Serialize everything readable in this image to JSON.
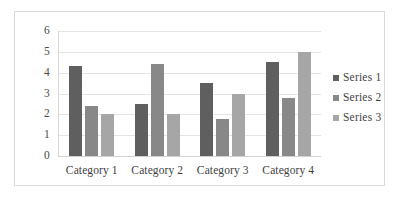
{
  "chart_data": {
    "type": "bar",
    "title": "",
    "xlabel": "",
    "ylabel": "",
    "categories": [
      "Category 1",
      "Category 2",
      "Category 3",
      "Category 4"
    ],
    "series": [
      {
        "name": "Series 1",
        "color": "#5f5f5f",
        "values": [
          4.3,
          2.5,
          3.5,
          4.5
        ]
      },
      {
        "name": "Series 2",
        "color": "#888888",
        "values": [
          2.4,
          4.4,
          1.8,
          2.8
        ]
      },
      {
        "name": "Series 3",
        "color": "#a6a6a6",
        "values": [
          2.0,
          2.0,
          3.0,
          5.0
        ]
      }
    ],
    "ylim": [
      0,
      6
    ],
    "y_ticks": [
      "0",
      "1",
      "2",
      "3",
      "4",
      "5",
      "6"
    ],
    "grid": true,
    "legend_position": "right",
    "frame_border_color": "#d9d9d9",
    "gridline_color": "#e4e4e4"
  }
}
